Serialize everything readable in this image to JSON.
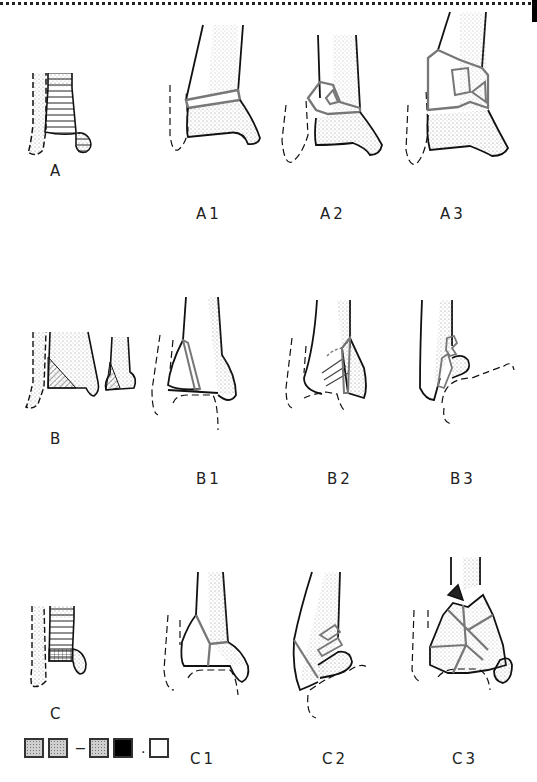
{
  "figure": {
    "title": "",
    "groups": [
      {
        "id": "A",
        "overview_label": "A",
        "subtypes": [
          "A1",
          "A2",
          "A3"
        ]
      },
      {
        "id": "B",
        "overview_label": "B",
        "subtypes": [
          "B1",
          "B2",
          "B3"
        ]
      },
      {
        "id": "C",
        "overview_label": "C",
        "subtypes": [
          "C1",
          "C2",
          "C3"
        ]
      }
    ],
    "legend": {
      "items": [
        "dotted",
        "dotted",
        "dash",
        "dotted",
        "black",
        "dot",
        "white"
      ],
      "separators": [
        "–",
        "."
      ]
    }
  },
  "colors": {
    "outline": "#111111",
    "fracture_line": "#7a7a7a",
    "stipple": "#bbbbbb",
    "background": "#ffffff"
  }
}
